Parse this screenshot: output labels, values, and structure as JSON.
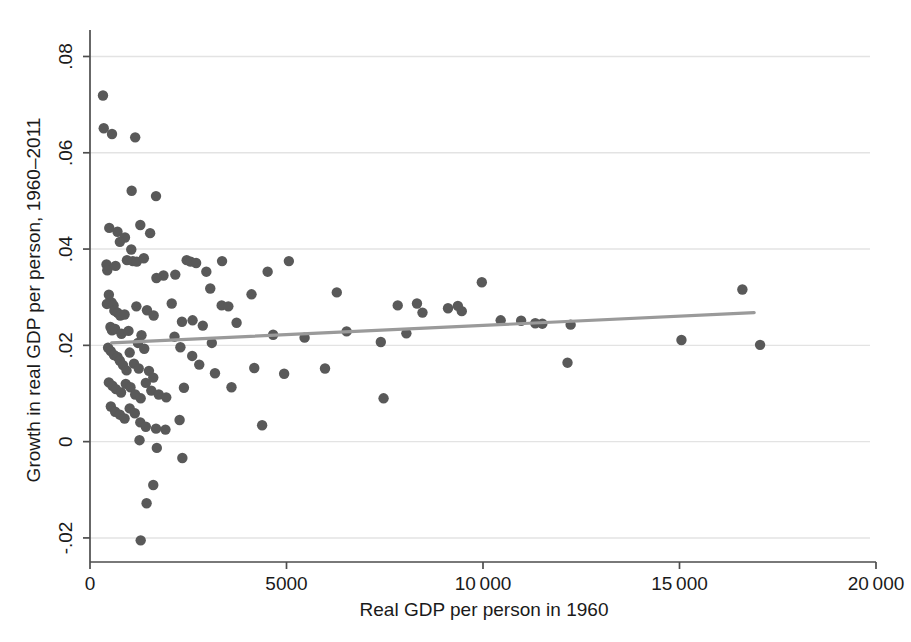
{
  "chart_data": {
    "type": "scatter",
    "title": "",
    "xlabel": "Real GDP per person in 1960",
    "ylabel": "Growth in real GDP per person, 1960–2011",
    "xlim": [
      0,
      20000
    ],
    "ylim": [
      -0.025,
      0.0855
    ],
    "xticks": [
      0,
      5000,
      10000,
      15000,
      20000
    ],
    "xticklabels": [
      "0",
      "5000",
      "10 000",
      "15 000",
      "20 000"
    ],
    "yticks": [
      -0.02,
      0,
      0.02,
      0.04,
      0.06,
      0.08
    ],
    "yticklabels": [
      "-.02",
      "0",
      ".02",
      ".04",
      ".06",
      ".08"
    ],
    "grid": "horizontal",
    "legend": "none",
    "marker_color": "#595959",
    "gridline_color": "#e3e3e3",
    "axis_color": "#4d4d4d",
    "trendline_color": "#9a9a9a",
    "trendline": {
      "label": "linear fit",
      "x_start": 550,
      "y_start": 0.0205,
      "x_end": 16900,
      "y_end": 0.0268
    },
    "points": [
      [
        330,
        0.0719
      ],
      [
        350,
        0.0651
      ],
      [
        560,
        0.0639
      ],
      [
        1150,
        0.0632
      ],
      [
        1060,
        0.0521
      ],
      [
        1680,
        0.051
      ],
      [
        1280,
        0.045
      ],
      [
        490,
        0.0444
      ],
      [
        700,
        0.0436
      ],
      [
        1530,
        0.0433
      ],
      [
        890,
        0.0424
      ],
      [
        760,
        0.0415
      ],
      [
        1050,
        0.0399
      ],
      [
        2460,
        0.0377
      ],
      [
        2560,
        0.0374
      ],
      [
        2700,
        0.0371
      ],
      [
        940,
        0.0377
      ],
      [
        1090,
        0.0375
      ],
      [
        1190,
        0.0374
      ],
      [
        1370,
        0.0381
      ],
      [
        2960,
        0.0353
      ],
      [
        3360,
        0.0375
      ],
      [
        420,
        0.0368
      ],
      [
        440,
        0.0356
      ],
      [
        650,
        0.0365
      ],
      [
        1870,
        0.0345
      ],
      [
        1690,
        0.034
      ],
      [
        2170,
        0.0347
      ],
      [
        3060,
        0.0318
      ],
      [
        5060,
        0.0375
      ],
      [
        4520,
        0.0353
      ],
      [
        4110,
        0.0306
      ],
      [
        6280,
        0.031
      ],
      [
        9970,
        0.0331
      ],
      [
        16600,
        0.0316
      ],
      [
        480,
        0.0305
      ],
      [
        550,
        0.0289
      ],
      [
        430,
        0.0286
      ],
      [
        600,
        0.0283
      ],
      [
        620,
        0.0272
      ],
      [
        700,
        0.0268
      ],
      [
        770,
        0.0262
      ],
      [
        880,
        0.0264
      ],
      [
        1180,
        0.0281
      ],
      [
        1450,
        0.0273
      ],
      [
        1620,
        0.0262
      ],
      [
        2080,
        0.0287
      ],
      [
        2340,
        0.0249
      ],
      [
        2610,
        0.0252
      ],
      [
        3350,
        0.0283
      ],
      [
        3520,
        0.0281
      ],
      [
        3730,
        0.0247
      ],
      [
        7830,
        0.0283
      ],
      [
        8320,
        0.0287
      ],
      [
        8460,
        0.0268
      ],
      [
        9110,
        0.0277
      ],
      [
        9360,
        0.0282
      ],
      [
        9460,
        0.0271
      ],
      [
        10450,
        0.0252
      ],
      [
        10970,
        0.0251
      ],
      [
        11330,
        0.0246
      ],
      [
        11510,
        0.0245
      ],
      [
        12230,
        0.0243
      ],
      [
        520,
        0.0238
      ],
      [
        560,
        0.0231
      ],
      [
        640,
        0.0234
      ],
      [
        800,
        0.0224
      ],
      [
        980,
        0.023
      ],
      [
        1310,
        0.0221
      ],
      [
        1220,
        0.0205
      ],
      [
        2150,
        0.0218
      ],
      [
        2870,
        0.0241
      ],
      [
        3100,
        0.0205
      ],
      [
        4660,
        0.0222
      ],
      [
        5460,
        0.0216
      ],
      [
        6530,
        0.0229
      ],
      [
        7400,
        0.0207
      ],
      [
        8050,
        0.0225
      ],
      [
        460,
        0.0195
      ],
      [
        530,
        0.0188
      ],
      [
        610,
        0.018
      ],
      [
        700,
        0.0176
      ],
      [
        760,
        0.0168
      ],
      [
        840,
        0.0159
      ],
      [
        930,
        0.0148
      ],
      [
        1010,
        0.0185
      ],
      [
        1120,
        0.0162
      ],
      [
        1240,
        0.0152
      ],
      [
        1380,
        0.0193
      ],
      [
        1500,
        0.0147
      ],
      [
        1610,
        0.0133
      ],
      [
        2300,
        0.0196
      ],
      [
        2600,
        0.0178
      ],
      [
        2780,
        0.016
      ],
      [
        3180,
        0.0142
      ],
      [
        4180,
        0.0153
      ],
      [
        4940,
        0.0141
      ],
      [
        5980,
        0.0152
      ],
      [
        12150,
        0.0164
      ],
      [
        15050,
        0.0211
      ],
      [
        17050,
        0.0201
      ],
      [
        480,
        0.0123
      ],
      [
        570,
        0.0116
      ],
      [
        660,
        0.0109
      ],
      [
        790,
        0.0102
      ],
      [
        910,
        0.012
      ],
      [
        1030,
        0.0113
      ],
      [
        1150,
        0.0098
      ],
      [
        1290,
        0.009
      ],
      [
        1420,
        0.0122
      ],
      [
        1560,
        0.0106
      ],
      [
        1750,
        0.0098
      ],
      [
        1940,
        0.0092
      ],
      [
        2390,
        0.0112
      ],
      [
        3600,
        0.0113
      ],
      [
        4380,
        0.0034
      ],
      [
        7470,
        0.009
      ],
      [
        530,
        0.0073
      ],
      [
        640,
        0.0062
      ],
      [
        760,
        0.0056
      ],
      [
        880,
        0.0048
      ],
      [
        1010,
        0.0069
      ],
      [
        1140,
        0.0059
      ],
      [
        1280,
        0.004
      ],
      [
        1420,
        0.0031
      ],
      [
        1680,
        0.0027
      ],
      [
        1920,
        0.0025
      ],
      [
        2280,
        0.0045
      ],
      [
        1260,
        0.0003
      ],
      [
        1700,
        -0.0013
      ],
      [
        2350,
        -0.0034
      ],
      [
        1610,
        -0.009
      ],
      [
        1440,
        -0.0128
      ],
      [
        1290,
        -0.0205
      ]
    ]
  }
}
